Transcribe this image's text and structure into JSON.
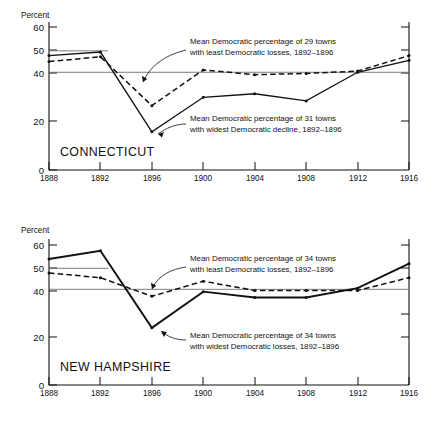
{
  "charts": [
    {
      "id": "connecticut",
      "state_label": "CONNECTICUT",
      "y_axis_title": "Percent",
      "y_ticks": [
        "0",
        "20",
        "40",
        "50",
        "60"
      ],
      "x_ticks": [
        "1888",
        "1892",
        "1896",
        "1900",
        "1904",
        "1908",
        "1912",
        "1916"
      ],
      "annotation_upper": {
        "line1": "Mean Democratic percentage of 29 towns",
        "line2": "with least Democratic losses, 1892–1896"
      },
      "annotation_lower": {
        "line1": "Mean Democratic percentage of 31 towns",
        "line2": "with widest Democratic decline, 1892–1896"
      }
    },
    {
      "id": "newhampshire",
      "state_label": "NEW HAMPSHIRE",
      "y_axis_title": "Percent",
      "y_ticks": [
        "0",
        "20",
        "40",
        "50",
        "60"
      ],
      "x_ticks": [
        "1888",
        "1892",
        "1896",
        "1900",
        "1904",
        "1908",
        "1912",
        "1916"
      ],
      "annotation_upper": {
        "line1": "Mean Democratic percentage of 34 towns",
        "line2": "with least Democratic losses, 1892–1896"
      },
      "annotation_lower": {
        "line1": "Mean Democratic percentage of 34 towns",
        "line2": "with widest Democratic losses, 1892–1896"
      }
    }
  ],
  "chart_data": [
    {
      "type": "line",
      "title": "CONNECTICUT",
      "xlabel": "",
      "ylabel": "Percent",
      "x": [
        1888,
        1892,
        1896,
        1900,
        1904,
        1908,
        1912,
        1916
      ],
      "xlim": [
        1888,
        1916
      ],
      "ylim": [
        0,
        63
      ],
      "y_ticks": [
        0,
        20,
        40,
        50,
        60
      ],
      "x_ticks": [
        1888,
        1892,
        1896,
        1900,
        1904,
        1908,
        1912,
        1916
      ],
      "grid": false,
      "legend": "annotations-inline",
      "reference_lines": [
        {
          "label": "upper reference",
          "value": 50.0,
          "x_start": 1888,
          "x_end": 1892.6
        },
        {
          "label": "lower reference",
          "value": 41.0,
          "x_start": 1888,
          "x_end": 1916
        }
      ],
      "series": [
        {
          "name": "Mean Democratic percentage of 31 towns with widest Democratic decline, 1892-1896",
          "style": "solid",
          "values": [
            48.0,
            49.5,
            16.0,
            30.5,
            32.0,
            29.0,
            41.0,
            46.0
          ]
        },
        {
          "name": "Mean Democratic percentage of 29 towns with least Democratic losses, 1892-1896",
          "style": "dashed",
          "values": [
            45.5,
            47.5,
            27.0,
            42.0,
            40.0,
            40.5,
            41.5,
            48.0
          ]
        }
      ]
    },
    {
      "type": "line",
      "title": "NEW HAMPSHIRE",
      "xlabel": "",
      "ylabel": "Percent",
      "x": [
        1888,
        1892,
        1896,
        1900,
        1904,
        1908,
        1912,
        1916
      ],
      "xlim": [
        1888,
        1916
      ],
      "ylim": [
        0,
        63
      ],
      "y_ticks": [
        0,
        20,
        40,
        50,
        60
      ],
      "x_ticks": [
        1888,
        1892,
        1896,
        1900,
        1904,
        1908,
        1912,
        1916
      ],
      "grid": false,
      "legend": "annotations-inline",
      "reference_lines": [
        {
          "label": "upper reference",
          "value": 50.0,
          "x_start": 1888,
          "x_end": 1892.6
        },
        {
          "label": "lower reference",
          "value": 41.0,
          "x_start": 1888,
          "x_end": 1916
        }
      ],
      "series": [
        {
          "name": "Mean Democratic percentage of 34 towns with widest Democratic losses, 1892-1896",
          "style": "solid",
          "values": [
            54.0,
            57.5,
            24.5,
            40.0,
            37.5,
            37.5,
            41.5,
            52.0
          ]
        },
        {
          "name": "Mean Democratic percentage of 34 towns with least Democratic losses, 1892-1896",
          "style": "dashed",
          "values": [
            48.0,
            46.0,
            38.0,
            44.5,
            40.5,
            40.5,
            40.5,
            46.0
          ]
        }
      ]
    }
  ]
}
